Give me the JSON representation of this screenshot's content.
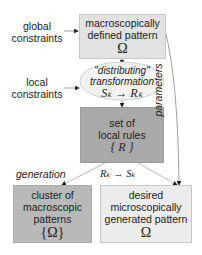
{
  "diagram": {
    "inputs": {
      "global_constraints": [
        "global",
        "constraints"
      ],
      "local_constraints": [
        "local",
        "constraints"
      ]
    },
    "nodes": {
      "macro_pattern": {
        "lines": [
          "macroscopically",
          "defined pattern"
        ],
        "symbol": "Ω",
        "fill": "#e2e2e2"
      },
      "transformation": {
        "lines": [
          "\"distributing\"",
          "transformation"
        ],
        "formula": "Sₖ → Rₖ",
        "fill": "#f2f2f2"
      },
      "local_rules": {
        "lines": [
          "set of",
          "local rules"
        ],
        "symbol": "{ R }",
        "fill": "#a9a9a9"
      },
      "cluster": {
        "lines": [
          "cluster of",
          "macroscopic",
          "patterns"
        ],
        "symbol": "{Ω}",
        "fill": "#b9b9b9"
      },
      "desired": {
        "lines": [
          "desired",
          "microscopically",
          "generated pattern"
        ],
        "symbol": "Ω",
        "fill": "#ececec"
      }
    },
    "edge_labels": {
      "generation": "generation",
      "inverse": "Rₖ → Sₖ",
      "parameters": "parameters"
    }
  }
}
